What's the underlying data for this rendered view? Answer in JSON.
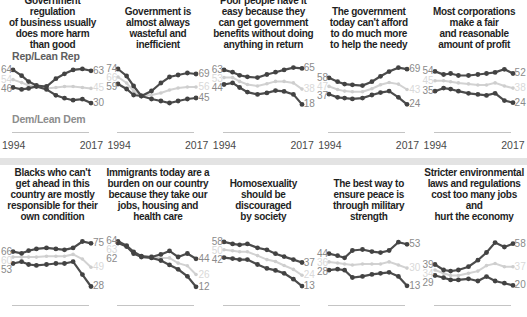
{
  "legend": {
    "rep": "Rep/Lean Rep",
    "dem": "Dem/Lean Dem"
  },
  "axis": {
    "start": "1994",
    "end": "2017"
  },
  "colors": {
    "party_line": "#4c4c4c",
    "party_dot": "#424242",
    "total_line": "#d2d2d2",
    "total_dot": "#cecece",
    "value_label": "#8a8a8a",
    "total_label": "#d9d9d9",
    "title_text": "#1f1f1f",
    "divider": "#e3e3e3",
    "baseline": "#c4c4c4"
  },
  "chart_data": {
    "type": "line",
    "x_years": [
      1994,
      1999,
      2002,
      2004,
      2007,
      2009,
      2011,
      2014,
      2016,
      2017
    ],
    "x_norm": [
      0,
      0.11,
      0.2,
      0.3,
      0.43,
      0.55,
      0.66,
      0.77,
      0.89,
      1
    ],
    "xlabel_start": "1994",
    "xlabel_end": "2017",
    "panels": [
      {
        "title_lines": [
          "Government regulation",
          "of business usually",
          "does more harm",
          "than good"
        ],
        "series": {
          "rep": {
            "name": "Rep/Lean Rep",
            "values": [
              64,
              58,
              52,
              48,
              47,
              55,
              60,
              64,
              65,
              63
            ],
            "start_label": "64",
            "end_label": "63"
          },
          "dem": {
            "name": "Dem/Lean Dem",
            "values": [
              46,
              44,
              45,
              47,
              44,
              38,
              35,
              33,
              34,
              30
            ],
            "start_label": "46",
            "end_label": "30"
          },
          "total": {
            "name": "Total",
            "values": [
              54,
              51,
              48,
              47,
              45,
              46,
              47,
              47,
              46,
              45
            ],
            "start_label": "54",
            "end_label": "45"
          }
        }
      },
      {
        "title_lines": [
          "Government is",
          "almost always",
          "wasteful and",
          "inefficient"
        ],
        "series": {
          "rep": {
            "name": "Rep/Lean Rep",
            "values": [
              74,
              67,
              57,
              47,
              52,
              60,
              66,
              68,
              70,
              69
            ],
            "start_label": "74",
            "end_label": "69"
          },
          "dem": {
            "name": "Dem/Lean Dem",
            "values": [
              59,
              54,
              48,
              47,
              44,
              42,
              40,
              42,
              44,
              45
            ],
            "start_label": "59",
            "end_label": "45"
          },
          "total": {
            "name": "Total",
            "values": [
              66,
              60,
              52,
              47,
              48,
              50,
              53,
              55,
              56,
              56
            ],
            "start_label": "66",
            "end_label": "56"
          }
        }
      },
      {
        "title_lines": [
          "Poor people have it",
          "easy because they",
          "can get government",
          "benefits without doing",
          "anything in return"
        ],
        "series": {
          "rep": {
            "name": "Rep/Lean Rep",
            "values": [
              63,
              60,
              56,
              54,
              53,
              57,
              60,
              63,
              66,
              65
            ],
            "start_label": "63",
            "end_label": "65"
          },
          "dem": {
            "name": "Dem/Lean Dem",
            "values": [
              44,
              46,
              40,
              34,
              31,
              33,
              36,
              35,
              31,
              18
            ],
            "start_label": "44",
            "end_label": "18"
          },
          "total": {
            "name": "Total",
            "values": [
              53,
              53,
              48,
              44,
              42,
              45,
              48,
              48,
              46,
              38
            ],
            "start_label": "53",
            "end_label": "38"
          }
        }
      },
      {
        "title_lines": [
          "The government",
          "today can't afford",
          "to do much more",
          "to help the needy"
        ],
        "series": {
          "rep": {
            "name": "Rep/Lean Rep",
            "values": [
              58,
              53,
              50,
              49,
              48,
              53,
              60,
              66,
              71,
              69
            ],
            "start_label": "58",
            "end_label": "69"
          },
          "dem": {
            "name": "Dem/Lean Dem",
            "values": [
              37,
              33,
              32,
              31,
              32,
              36,
              39,
              41,
              33,
              24
            ],
            "start_label": "37",
            "end_label": "24"
          },
          "total": {
            "name": "Total",
            "values": [
              47,
              43,
              41,
              40,
              40,
              44,
              49,
              52,
              50,
              43
            ],
            "start_label": "47",
            "end_label": "43"
          }
        }
      },
      {
        "title_lines": [
          "Most corporations",
          "make a fair",
          "and reasonable",
          "amount of profit"
        ],
        "series": {
          "rep": {
            "name": "Rep/Lean Rep",
            "values": [
              54,
              51,
              52,
              50,
              50,
              51,
              52,
              53,
              56,
              52
            ],
            "start_label": "54",
            "end_label": "52"
          },
          "dem": {
            "name": "Dem/Lean Dem",
            "values": [
              35,
              38,
              37,
              35,
              33,
              32,
              31,
              33,
              26,
              24
            ],
            "start_label": "35",
            "end_label": "24"
          },
          "total": {
            "name": "Total",
            "values": [
              45,
              45,
              44,
              43,
              42,
              41,
              41,
              43,
              40,
              38
            ],
            "start_label": "45",
            "end_label": "38"
          }
        }
      },
      {
        "title_lines": [
          "Blacks who can't",
          "get ahead in this",
          "country are mostly",
          "responsible for their",
          "own condition"
        ],
        "series": {
          "rep": {
            "name": "Rep/Lean Rep",
            "values": [
              66,
              64,
              67,
              69,
              70,
              69,
              68,
              70,
              77,
              75
            ],
            "start_label": "66",
            "end_label": "75"
          },
          "dem": {
            "name": "Dem/Lean Dem",
            "values": [
              53,
              55,
              52,
              51,
              52,
              53,
              53,
              55,
              41,
              28
            ],
            "start_label": "53",
            "end_label": "28"
          },
          "total": {
            "name": "Total",
            "values": [
              60,
              60,
              60,
              60,
              61,
              61,
              61,
              63,
              58,
              49
            ],
            "start_label": "60",
            "end_label": "49"
          }
        }
      },
      {
        "title_lines": [
          "Immigrants today are a",
          "burden on our country",
          "because they take our",
          "jobs, housing and",
          "health care"
        ],
        "series": {
          "rep": {
            "name": "Rep/Lean Rep",
            "values": [
              64,
              59,
              52,
              47,
              46,
              49,
              53,
              46,
              50,
              44
            ],
            "start_label": "64",
            "end_label": "44"
          },
          "dem": {
            "name": "Dem/Lean Dem",
            "values": [
              62,
              58,
              50,
              46,
              45,
              42,
              37,
              32,
              24,
              12
            ],
            "start_label": "62",
            "end_label": "12"
          },
          "total": {
            "name": "Total",
            "values": [
              63,
              58,
              51,
              46,
              45,
              45,
              45,
              39,
              36,
              26
            ],
            "start_label": "63",
            "end_label": "26"
          }
        }
      },
      {
        "title_lines": [
          "Homosexuality",
          "should be",
          "discouraged",
          "by society"
        ],
        "series": {
          "rep": {
            "name": "Rep/Lean Rep",
            "values": [
              58,
              56,
              55,
              56,
              52,
              50,
              46,
              43,
              40,
              37
            ],
            "start_label": "58",
            "end_label": "37"
          },
          "dem": {
            "name": "Dem/Lean Dem",
            "values": [
              42,
              41,
              40,
              40,
              35,
              31,
              29,
              26,
              20,
              13
            ],
            "start_label": "42",
            "end_label": "13"
          },
          "total": {
            "name": "Total",
            "values": [
              50,
              49,
              48,
              48,
              44,
              40,
              38,
              34,
              30,
              24
            ],
            "start_label": "50",
            "end_label": "24"
          }
        }
      },
      {
        "title_lines": [
          "The best way to",
          "ensure peace is",
          "through military",
          "strength"
        ],
        "series": {
          "rep": {
            "name": "Rep/Lean Rep",
            "values": [
              44,
              42,
              40,
              47,
              48,
              46,
              45,
              47,
              55,
              53
            ],
            "start_label": "44",
            "end_label": "53"
          },
          "dem": {
            "name": "Dem/Lean Dem",
            "values": [
              28,
              29,
              28,
              21,
              22,
              24,
              25,
              26,
              22,
              13
            ],
            "start_label": "28",
            "end_label": "13"
          },
          "total": {
            "name": "Total",
            "values": [
              36,
              35,
              34,
              33,
              34,
              34,
              34,
              36,
              33,
              30
            ],
            "start_label": "36",
            "end_label": "30"
          }
        }
      },
      {
        "title_lines": [
          "Stricter environmental",
          "laws and regulations",
          "cost too many jobs and",
          "hurt the economy"
        ],
        "series": {
          "rep": {
            "name": "Rep/Lean Rep",
            "values": [
              39,
              34,
              33,
              34,
              37,
              43,
              50,
              59,
              55,
              58
            ],
            "start_label": "39",
            "end_label": "58"
          },
          "dem": {
            "name": "Dem/Lean Dem",
            "values": [
              29,
              27,
              25,
              25,
              26,
              24,
              28,
              24,
              22,
              20
            ],
            "start_label": "29",
            "end_label": "20"
          },
          "total": {
            "name": "Total",
            "values": [
              34,
              31,
              29,
              29,
              31,
              33,
              38,
              40,
              37,
              37
            ],
            "start_label": "34",
            "end_label": "37"
          }
        }
      }
    ]
  }
}
